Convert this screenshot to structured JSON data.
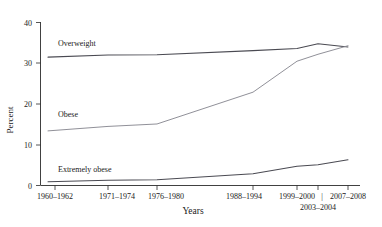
{
  "chart_data": {
    "type": "line",
    "title": "",
    "subtitle": "",
    "xlabel": "Years",
    "ylabel": "Percent",
    "ylim": [
      0,
      40
    ],
    "yticks": [
      0,
      10,
      20,
      30,
      40
    ],
    "ytick_labels": [
      "0",
      "10",
      "20",
      "30",
      "40"
    ],
    "grid": false,
    "legend_position": "inline-labels",
    "categories": [
      "1960–1962",
      "1971–1974",
      "1976–1980",
      "1988–1994",
      "1999–2000",
      "2003–2004",
      "2007–2008"
    ],
    "xtick_labels": [
      "1960–1962",
      "1971–1974",
      "1976–1980",
      "1988–1994",
      "1999–2000",
      "2003–2004",
      "2007–2008"
    ],
    "xtick_separator": "|",
    "series": [
      {
        "name": "Overweight",
        "values": [
          31.5,
          32.0,
          32.1,
          33.1,
          33.6,
          34.8,
          34.0
        ],
        "label_text": "Overweight"
      },
      {
        "name": "Obese",
        "values": [
          13.4,
          14.5,
          15.1,
          22.9,
          30.5,
          32.2,
          34.3
        ],
        "label_text": "Obese"
      },
      {
        "name": "Extremely obese",
        "values": [
          0.9,
          1.3,
          1.4,
          2.9,
          4.7,
          5.1,
          6.3
        ],
        "label_text": "Extremely obese"
      }
    ],
    "annotations": [
      {
        "text": "Overweight",
        "series": "Overweight"
      },
      {
        "text": "Obese",
        "series": "Obese"
      },
      {
        "text": "Extremely obese",
        "series": "Extremely obese"
      }
    ],
    "colors": {
      "line": "#4a4a52",
      "line_dim": "#8a8a92",
      "axis": "#2b2b2b",
      "text": "#1a1a1a",
      "background": "#ffffff"
    }
  },
  "axes": {
    "y_title": "Percent",
    "x_title": "Years",
    "y_ticks": [
      "40",
      "30",
      "20",
      "10",
      "0"
    ],
    "x_ticks_row1": [
      "1960–1962",
      "1971–1974",
      "1976–1980",
      "1988–1994",
      "1999–2000",
      "2007–2008"
    ],
    "x_ticks_row2": [
      "2003–2004"
    ],
    "separator": "|"
  },
  "labels": {
    "overweight": "Overweight",
    "obese": "Obese",
    "extremely_obese": "Extremely obese"
  }
}
